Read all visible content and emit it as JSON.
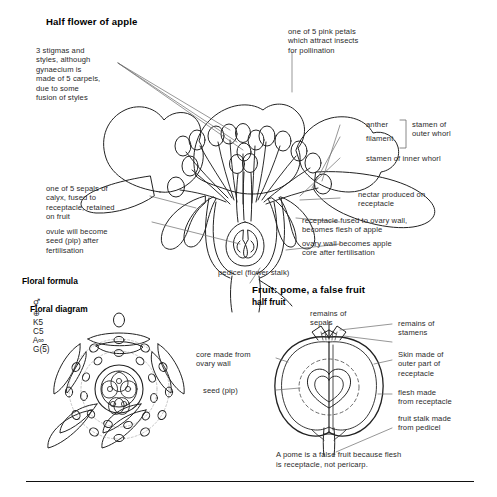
{
  "figure": {
    "title": "Half flower of apple",
    "domain": "botanical-diagram"
  },
  "flower": {
    "heading": "Half flower of apple",
    "labels": {
      "stigmas": "3 stigmas and\nstyles, although\ngynaecium is\nmade of 5 carpels,\ndue to some\nfusion of styles",
      "petals": "one of 5 pink petals\nwhich attract insects\nfor pollination",
      "anther": "anther",
      "filament": "filament",
      "stamen_outer": "stamen of\nouter whorl",
      "stamen_inner": "stamen of inner whorl",
      "sepals": "one of 5 sepals of\ncalyx, fused to\nreceptacle, retained\non fruit",
      "ovule": "ovule will become\nseed (pip) after\nfertilisation",
      "nectar": "nectar produced on\nreceptacle",
      "receptacle": "receptacle fused to ovary wall,\nbecomes flesh of apple",
      "ovary_wall": "ovary wall becomes apple\ncore after fertilisation",
      "pedicel": "pedicel (flower stalk)"
    }
  },
  "floral_formula": {
    "heading": "Floral formula",
    "symbol_bisexual": "⚥",
    "symbol_actinomorphic": "⊕",
    "calyx": "K5",
    "corolla": "C5",
    "androecium": "A∞",
    "gynoecium_prefix": "G(",
    "gynoecium_number": "5",
    "gynoecium_suffix": ")",
    "full_text": "⚥ ⊕ K5 C5 A∞ G(5̅)"
  },
  "floral_diagram": {
    "heading": "Floral diagram"
  },
  "fruit": {
    "heading": "Fruit: pome, a false fruit",
    "subheading": "half fruit",
    "labels": {
      "remains_sepals": "remains of\nsepals",
      "remains_stamens": "remains of\nstamens",
      "skin": "Skin made of\nouter part of\nreceptacle",
      "flesh": "flesh made\nfrom receptacle",
      "fruit_stalk": "fruit stalk made\nfrom pedicel",
      "core": "core made from\novary wall",
      "seed": "seed (pip)"
    },
    "footnote": "A pome is a false fruit because flesh\nis receptacle, not pericarp."
  },
  "colors": {
    "ink": "#1a1a1a",
    "line": "#2b2b2b",
    "leader": "#555555",
    "background": "#ffffff"
  }
}
